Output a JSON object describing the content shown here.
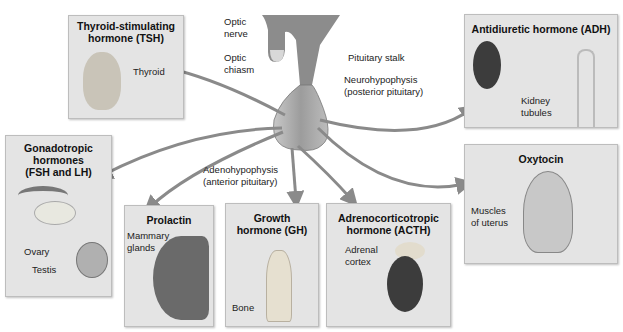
{
  "diagram": {
    "center": {
      "name": "Pituitary gland",
      "labels": {
        "optic_nerve": "Optic\nnerve",
        "optic_chiasm": "Optic\nchiasm",
        "pituitary_stalk": "Pituitary stalk",
        "neurohypophysis": "Neurohypophysis\n(posterior pituitary)",
        "adenohypophysis": "Adenohypophysis\n(anterior pituitary)"
      }
    },
    "boxes": {
      "tsh": {
        "title": "Thyroid-stimulating\nhormone (TSH)",
        "target": "Thyroid"
      },
      "gonadotropic": {
        "title": "Gonadotropic\nhormones\n(FSH and LH)",
        "targets": [
          "Ovary",
          "Testis"
        ]
      },
      "prolactin": {
        "title": "Prolactin",
        "target": "Mammary\nglands"
      },
      "gh": {
        "title": "Growth\nhormone (GH)",
        "target": "Bone"
      },
      "acth": {
        "title": "Adrenocorticotropic\nhormone (ACTH)",
        "target": "Adrenal\ncortex"
      },
      "adh": {
        "title": "Antidiuretic hormone (ADH)",
        "target": "Kidney\ntubules"
      },
      "oxytocin": {
        "title": "Oxytocin",
        "target": "Muscles\nof uterus"
      }
    },
    "colors": {
      "box_fill": "#e4e4e4",
      "arrow": "#8a8a8a",
      "gland": "#a8a8a8",
      "organ_dark": "#3c3c3c"
    }
  }
}
